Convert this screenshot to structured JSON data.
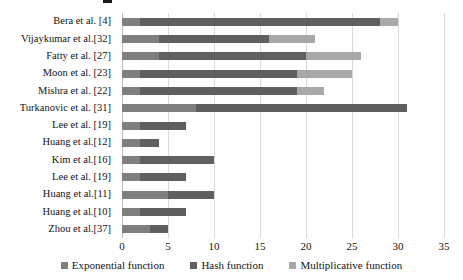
{
  "chart_data": {
    "type": "bar",
    "orientation": "horizontal",
    "stacked": true,
    "categories": [
      "Bera et al. [4]",
      "Vijaykumar  et al.[32]",
      "Fatty et al. [27]",
      "Moon et al. [23]",
      "Mishra et al. [22]",
      "Turkanovic et al. [31]",
      "Lee et al. [19]",
      "Huang et al.[12]",
      "Kim et al.[16]",
      "Lee et al. [19]",
      "Huang et al.[11]",
      "Huang et al.[10]",
      "Zhou et al.[37]"
    ],
    "series": [
      {
        "name": "Exponential function",
        "color": "#7f7f7f",
        "values": [
          2,
          4,
          4,
          2,
          2,
          8,
          2,
          2,
          2,
          2,
          5,
          2,
          3
        ]
      },
      {
        "name": "Hash function",
        "color": "#5f5f5f",
        "values": [
          26,
          12,
          16,
          17,
          17,
          23,
          5,
          2,
          8,
          5,
          5,
          5,
          2
        ]
      },
      {
        "name": "Multiplicative function",
        "color": "#a8a8a8",
        "values": [
          2,
          5,
          6,
          6,
          3,
          0,
          0,
          0,
          0,
          0,
          0,
          0,
          0
        ]
      }
    ],
    "totals": [
      30,
      21,
      26,
      25,
      22,
      31,
      7,
      4,
      10,
      7,
      10,
      7,
      5
    ],
    "xlim": [
      0,
      35
    ],
    "xticks": [
      0,
      5,
      10,
      15,
      20,
      25,
      30,
      35
    ],
    "grid": "vertical",
    "gridline_color": "#d9d9d9",
    "legend_position": "bottom",
    "title": "",
    "xlabel": "",
    "ylabel": ""
  }
}
